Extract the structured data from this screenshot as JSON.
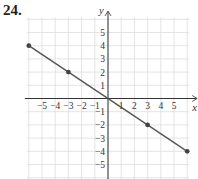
{
  "problem": {
    "number": "24."
  },
  "chart_data": {
    "type": "line",
    "title": "",
    "xlabel": "x",
    "ylabel": "y",
    "xlim": [
      -6,
      6
    ],
    "ylim": [
      -6,
      6
    ],
    "grid": true,
    "x_ticks": [
      -5,
      -4,
      -3,
      -2,
      -1,
      1,
      2,
      3,
      4,
      5
    ],
    "y_ticks": [
      5,
      4,
      3,
      2,
      1,
      -1,
      -2,
      -3,
      -4,
      -5
    ],
    "x_tick_labels": [
      "−5",
      "−4",
      "−3",
      "−2",
      "−1",
      "1",
      "2",
      "3",
      "4",
      "5"
    ],
    "y_tick_labels": [
      "5",
      "4",
      "3",
      "2",
      "1",
      "−1",
      "−2",
      "−3",
      "−4",
      "−5"
    ],
    "series": [
      {
        "name": "line",
        "equation": "y = -2/3 x",
        "x": [
          -6,
          6
        ],
        "y": [
          4,
          -4
        ]
      }
    ],
    "points": [
      {
        "x": -6,
        "y": 4
      },
      {
        "x": -3,
        "y": 2
      },
      {
        "x": 3,
        "y": -2
      },
      {
        "x": 6,
        "y": -4
      }
    ],
    "colors": {
      "line": "#555555",
      "point": "#444444",
      "grid": "#dddddd",
      "axis": "#333333"
    }
  }
}
